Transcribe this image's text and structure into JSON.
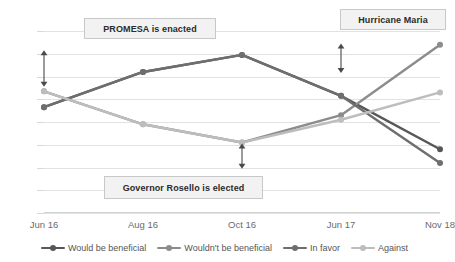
{
  "chart_data": {
    "type": "line",
    "title": "",
    "xlabel": "",
    "ylabel": "",
    "categories": [
      "Jun 16",
      "Aug 16",
      "Oct 16",
      "Jun 17",
      "Nov 18"
    ],
    "ylim": [
      0,
      0.8
    ],
    "ytick_labels": [
      "0",
      "0.1",
      "0.2",
      "0.3",
      "0.4",
      "0.5",
      "0.6",
      "0.7",
      "0.8"
    ],
    "ytick_values": [
      0,
      0.1,
      0.2,
      0.3,
      0.4,
      0.5,
      0.6,
      0.7,
      0.8
    ],
    "grid": true,
    "legend_position": "bottom",
    "series": [
      {
        "name": "Would be beneficial",
        "color": "#575757",
        "values": [
          0.465,
          0.62,
          0.695,
          0.515,
          0.28
        ]
      },
      {
        "name": "Wouldn't be beneficial",
        "color": "#8c8c8c",
        "values": [
          0.535,
          0.39,
          0.31,
          0.43,
          0.74
        ]
      },
      {
        "name": "In favor",
        "color": "#6e6e6e",
        "values": [
          0.465,
          0.62,
          0.695,
          0.515,
          0.22
        ]
      },
      {
        "name": "Against",
        "color": "#bdbdbd",
        "values": [
          0.535,
          0.39,
          0.31,
          0.41,
          0.53
        ]
      }
    ],
    "annotations": [
      {
        "id": "promesa",
        "label": "PROMESA is enacted",
        "arrow_x_category": "Jun 16",
        "arrow_from": 0.715,
        "arrow_to": 0.555
      },
      {
        "id": "hurricane-maria",
        "label": "Hurricane Maria",
        "arrow_x_category": "Jun 17",
        "arrow_from": 0.745,
        "arrow_to": 0.615
      },
      {
        "id": "governor-rosello",
        "label": "Governor Rosello is elected",
        "arrow_x_category": "Oct 16",
        "arrow_from": 0.305,
        "arrow_to": 0.195
      }
    ]
  }
}
